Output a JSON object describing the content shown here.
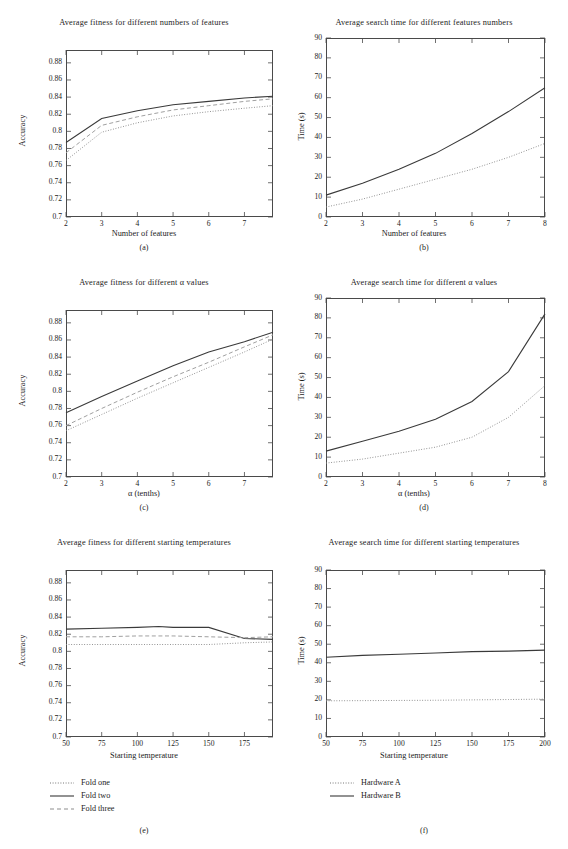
{
  "figure": {
    "panel_captions": [
      "(a)",
      "(b)",
      "(c)",
      "(d)",
      "(e)",
      "(f)"
    ]
  },
  "legends": {
    "left": {
      "name": "fold-legend",
      "items": [
        {
          "label": "Fold one",
          "style": "dotted"
        },
        {
          "label": "Fold two",
          "style": "solid"
        },
        {
          "label": "Fold three",
          "style": "dashed"
        }
      ]
    },
    "right": {
      "name": "hardware-legend",
      "items": [
        {
          "label": "Hardware A",
          "style": "dotted"
        },
        {
          "label": "Hardware B",
          "style": "solid"
        }
      ]
    }
  },
  "chart_data": [
    {
      "id": "a",
      "type": "line",
      "title": "Average fitness for different numbers of features",
      "xlabel": "Number of features",
      "ylabel": "Accuracy",
      "xlim": [
        2,
        7.8
      ],
      "ylim": [
        0.7,
        0.895
      ],
      "xticks": [
        2,
        3,
        4,
        5,
        6,
        7
      ],
      "yticks": [
        0.7,
        0.72,
        0.74,
        0.76,
        0.78,
        0.8,
        0.82,
        0.84,
        0.86,
        0.88
      ],
      "x": [
        2,
        3,
        4,
        5,
        6,
        7,
        7.8
      ],
      "grid": false,
      "legend": "none",
      "series": [
        {
          "name": "Fold one",
          "style": "dotted",
          "values": [
            0.766,
            0.799,
            0.81,
            0.818,
            0.823,
            0.827,
            0.83
          ]
        },
        {
          "name": "Fold two",
          "style": "solid",
          "values": [
            0.787,
            0.815,
            0.824,
            0.831,
            0.835,
            0.839,
            0.841
          ]
        },
        {
          "name": "Fold three",
          "style": "dashed",
          "values": [
            0.775,
            0.807,
            0.817,
            0.825,
            0.83,
            0.835,
            0.838
          ]
        }
      ]
    },
    {
      "id": "b",
      "type": "line",
      "title": "Average search time for different features numbers",
      "xlabel": "Number of features",
      "ylabel": "Time (s)",
      "xlim": [
        2,
        8
      ],
      "ylim": [
        0,
        90
      ],
      "xticks": [
        2,
        3,
        4,
        5,
        6,
        7,
        8
      ],
      "yticks": [
        0,
        10,
        20,
        30,
        40,
        50,
        60,
        70,
        80,
        90
      ],
      "x": [
        2,
        3,
        4,
        5,
        6,
        7,
        8
      ],
      "grid": false,
      "legend": "none",
      "series": [
        {
          "name": "Hardware A",
          "style": "dotted",
          "values": [
            5,
            9,
            14,
            19,
            24,
            30,
            37
          ]
        },
        {
          "name": "Hardware B",
          "style": "solid",
          "values": [
            11,
            17,
            24,
            32,
            42,
            53,
            65
          ]
        }
      ]
    },
    {
      "id": "c",
      "type": "line",
      "title": "Average fitness for different α values",
      "xlabel": "α (tenths)",
      "ylabel": "Accuracy",
      "xlim": [
        2,
        7.8
      ],
      "ylim": [
        0.7,
        0.895
      ],
      "xticks": [
        2,
        3,
        4,
        5,
        6,
        7
      ],
      "yticks": [
        0.7,
        0.72,
        0.74,
        0.76,
        0.78,
        0.8,
        0.82,
        0.84,
        0.86,
        0.88
      ],
      "x": [
        2,
        3,
        4,
        5,
        6,
        7,
        7.8
      ],
      "grid": false,
      "legend": "none",
      "series": [
        {
          "name": "Fold one",
          "style": "dotted",
          "values": [
            0.754,
            0.773,
            0.792,
            0.81,
            0.828,
            0.846,
            0.861
          ]
        },
        {
          "name": "Fold two",
          "style": "solid",
          "values": [
            0.775,
            0.794,
            0.812,
            0.83,
            0.846,
            0.858,
            0.869
          ]
        },
        {
          "name": "Fold three",
          "style": "dashed",
          "values": [
            0.76,
            0.78,
            0.799,
            0.817,
            0.834,
            0.852,
            0.866
          ]
        }
      ]
    },
    {
      "id": "d",
      "type": "line",
      "title": "Average search time for different α values",
      "xlabel": "α (tenths)",
      "ylabel": "Time (s)",
      "xlim": [
        2,
        8
      ],
      "ylim": [
        0,
        90
      ],
      "xticks": [
        2,
        3,
        4,
        5,
        6,
        7,
        8
      ],
      "yticks": [
        0,
        10,
        20,
        30,
        40,
        50,
        60,
        70,
        80,
        90
      ],
      "x": [
        2,
        3,
        4,
        5,
        6,
        7,
        8
      ],
      "grid": false,
      "legend": "none",
      "series": [
        {
          "name": "Hardware A",
          "style": "dotted",
          "values": [
            7,
            9,
            12,
            15,
            20,
            30,
            46
          ]
        },
        {
          "name": "Hardware B",
          "style": "solid",
          "values": [
            13,
            18,
            23,
            29,
            38,
            53,
            82
          ]
        }
      ]
    },
    {
      "id": "e",
      "type": "line",
      "title": "Average fitness for different starting temperatures",
      "xlabel": "Starting temperature",
      "ylabel": "Accuracy",
      "xlim": [
        50,
        195
      ],
      "ylim": [
        0.7,
        0.895
      ],
      "xticks": [
        50,
        75,
        100,
        125,
        150,
        175
      ],
      "yticks": [
        0.7,
        0.72,
        0.74,
        0.76,
        0.78,
        0.8,
        0.82,
        0.84,
        0.86,
        0.88
      ],
      "x": [
        50,
        75,
        100,
        115,
        125,
        150,
        175,
        195
      ],
      "grid": false,
      "legend": "none",
      "series": [
        {
          "name": "Fold one",
          "style": "dotted",
          "values": [
            0.808,
            0.808,
            0.808,
            0.808,
            0.808,
            0.808,
            0.81,
            0.811
          ]
        },
        {
          "name": "Fold two",
          "style": "solid",
          "values": [
            0.826,
            0.827,
            0.828,
            0.829,
            0.828,
            0.828,
            0.815,
            0.814
          ]
        },
        {
          "name": "Fold three",
          "style": "dashed",
          "values": [
            0.817,
            0.817,
            0.818,
            0.818,
            0.818,
            0.817,
            0.816,
            0.817
          ]
        }
      ]
    },
    {
      "id": "f",
      "type": "line",
      "title": "Average search time for different starting temperatures",
      "xlabel": "Starting temperature",
      "ylabel": "Time (s)",
      "xlim": [
        50,
        200
      ],
      "ylim": [
        0,
        90
      ],
      "xticks": [
        50,
        75,
        100,
        125,
        150,
        175,
        200
      ],
      "yticks": [
        0,
        10,
        20,
        30,
        40,
        50,
        60,
        70,
        80,
        90
      ],
      "x": [
        50,
        75,
        100,
        125,
        150,
        175,
        200
      ],
      "grid": false,
      "legend": "none",
      "series": [
        {
          "name": "Hardware A",
          "style": "dotted",
          "values": [
            19.5,
            19.6,
            19.7,
            19.8,
            20.0,
            20.2,
            20.4
          ]
        },
        {
          "name": "Hardware B",
          "style": "solid",
          "values": [
            43,
            44,
            44.6,
            45.3,
            46,
            46.3,
            46.8
          ]
        }
      ]
    }
  ]
}
